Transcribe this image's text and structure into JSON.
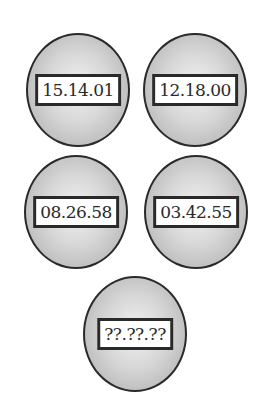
{
  "header": {
    "text": ""
  },
  "balls": [
    {
      "label": "15.14.01"
    },
    {
      "label": "12.18.00"
    },
    {
      "label": "08.26.58"
    },
    {
      "label": "03.42.55"
    },
    {
      "label": "??.??.??"
    }
  ],
  "colors": {
    "outline": "#2a2a2a",
    "ball_light": "#f2f2f2",
    "ball_dark": "#a9a9a9",
    "label_bg": "#ffffff"
  }
}
